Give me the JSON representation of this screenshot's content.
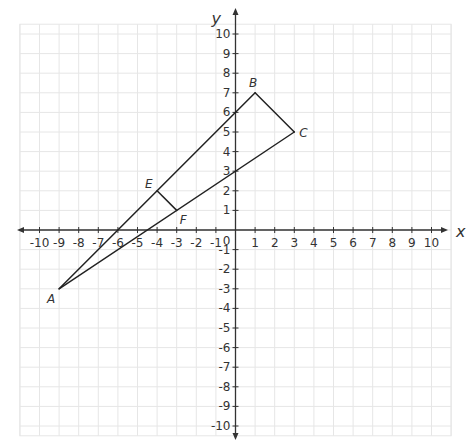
{
  "chart_data": {
    "type": "scatter",
    "title": "",
    "xlabel": "x",
    "ylabel": "y",
    "xlim": [
      -11,
      11
    ],
    "ylim": [
      -10.5,
      10.5
    ],
    "grid": true,
    "x_ticks": [
      -10,
      -9,
      -8,
      -7,
      -6,
      -5,
      -4,
      -3,
      -2,
      -1,
      1,
      2,
      3,
      4,
      5,
      6,
      7,
      8,
      9,
      10
    ],
    "y_ticks": [
      10,
      9,
      8,
      7,
      6,
      5,
      4,
      3,
      2,
      1,
      -1,
      -2,
      -3,
      -4,
      -5,
      -6,
      -7,
      -8,
      -9,
      -10
    ],
    "origin_label": "0",
    "points": [
      {
        "name": "A",
        "x": -9,
        "y": -3
      },
      {
        "name": "B",
        "x": 1,
        "y": 7
      },
      {
        "name": "C",
        "x": 3,
        "y": 5
      },
      {
        "name": "E",
        "x": -4,
        "y": 2
      },
      {
        "name": "F",
        "x": -3,
        "y": 1
      }
    ],
    "segments": [
      [
        "A",
        "B"
      ],
      [
        "B",
        "C"
      ],
      [
        "C",
        "A"
      ],
      [
        "E",
        "F"
      ]
    ]
  },
  "colors": {
    "grid": "#e6e6e6",
    "axis": "#333333",
    "line": "#222222"
  }
}
